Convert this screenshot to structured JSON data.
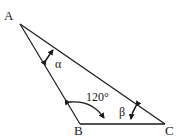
{
  "diagram": {
    "type": "triangle",
    "vertices": [
      {
        "id": "A",
        "label": "A"
      },
      {
        "id": "B",
        "label": "B"
      },
      {
        "id": "C",
        "label": "C"
      }
    ],
    "angles": {
      "alpha": {
        "label": "α",
        "at": "A"
      },
      "B": {
        "label": "120°",
        "at": "B"
      },
      "beta": {
        "label": "β",
        "at": "C"
      }
    },
    "colors": {
      "stroke": "#1a1a1a",
      "background": "#ffffff"
    }
  }
}
